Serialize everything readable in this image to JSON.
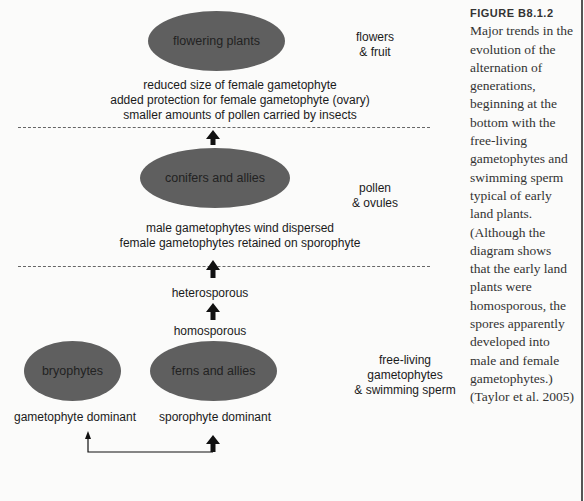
{
  "figure": {
    "title": "FIGURE B8.1.2",
    "caption_lines": [
      "Major trends in the",
      "evolution of the",
      "alternation of",
      "generations,",
      "beginning at the",
      "bottom with the",
      "free-living",
      "gametophytes and",
      "swimming sperm",
      "typical of early",
      "land plants.",
      "(Although the",
      "diagram shows",
      "that the early land",
      "plants were",
      "homosporous, the",
      "spores apparently",
      "developed into",
      "male and female",
      "gametophytes.)",
      "(Taylor et al. 2005)"
    ]
  },
  "nodes": {
    "flowering": "flowering plants",
    "conifers": "conifers and allies",
    "bryophytes": "bryophytes",
    "ferns": "ferns and allies"
  },
  "labels": {
    "flowering_trends": [
      "reduced size of female gametophyte",
      "added protection for female gametophyte (ovary)",
      "smaller amounts of pollen carried by insects"
    ],
    "conifer_trends": [
      "male gametophytes wind dispersed",
      "female gametophytes retained on sporophyte"
    ],
    "heterosporous": "heterosporous",
    "homosporous": "homosporous",
    "gametophyte_dominant": "gametophyte dominant",
    "sporophyte_dominant": "sporophyte dominant"
  },
  "side_labels": {
    "top": [
      "flowers",
      "& fruit"
    ],
    "middle": [
      "pollen",
      "& ovules"
    ],
    "bottom": [
      "free-living",
      "gametophytes",
      "& swimming sperm"
    ]
  },
  "colors": {
    "ellipse_fill": "#5f5f5f",
    "background": "#fbfbfa",
    "arrow": "#111111"
  }
}
